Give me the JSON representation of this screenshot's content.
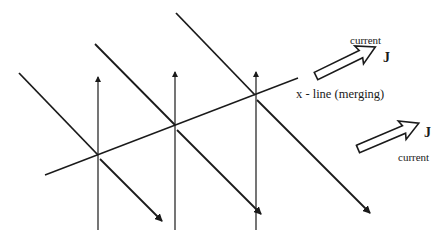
{
  "diagram": {
    "type": "magnetic-reconnection-schematic",
    "colors": {
      "ink": "#1a1a1a",
      "background": "#ffffff"
    },
    "labels": {
      "xline": "x - line (merging)",
      "current_top": "current",
      "j_top": "J",
      "j_bottom": "J",
      "current_bottom": "current"
    },
    "xline": {
      "from": [
        45,
        175
      ],
      "to": [
        298,
        78
      ]
    },
    "field_lines": [
      {
        "upper": {
          "from": [
            19,
            73
          ],
          "to": [
            98,
            155
          ]
        },
        "lower_arrow": {
          "from": [
            100,
            159
          ],
          "to": [
            162,
            221
          ]
        },
        "vertical": {
          "x": 98,
          "top": 76,
          "bottom": 230
        }
      },
      {
        "upper": {
          "from": [
            95,
            44
          ],
          "to": [
            175,
            125
          ]
        },
        "lower_arrow": {
          "from": [
            177,
            130
          ],
          "to": [
            261,
            214
          ]
        },
        "vertical": {
          "x": 175,
          "top": 71,
          "bottom": 230
        }
      },
      {
        "upper": {
          "from": [
            176,
            13
          ],
          "to": [
            255,
            95
          ]
        },
        "lower_arrow": {
          "from": [
            257,
            100
          ],
          "to": [
            370,
            213
          ]
        },
        "vertical": {
          "x": 256,
          "top": 71,
          "bottom": 230
        }
      }
    ],
    "current_arrows": [
      {
        "name": "current-arrow-top",
        "tail": [
          316,
          76
        ],
        "tip": [
          375,
          47
        ]
      },
      {
        "name": "current-arrow-bottom",
        "tail": [
          358,
          149
        ],
        "tip": [
          418,
          124
        ]
      }
    ]
  }
}
